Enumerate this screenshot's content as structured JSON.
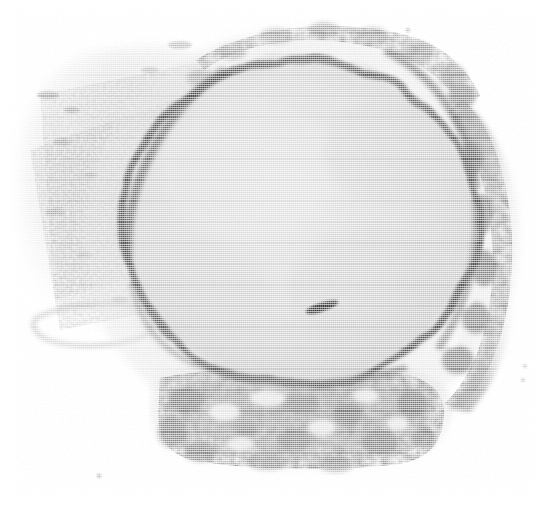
{
  "image": {
    "kind": "electron-micrograph",
    "reproduction": "halftone-line-screen-scan",
    "width": 550,
    "height": 507,
    "background_color": "#ffffff",
    "alt_text": "Halftone-printed transmission electron micrograph of a cell showing a large round nucleus bounded by a dark nuclear envelope, with a small dark intranuclear inclusion and granular cytoplasm surrounding it."
  },
  "palette": {
    "paper_white": "#ffffff",
    "nucleoplasm_gray": "#c9c9c9",
    "nucleoplasm_light": "#d8d8d8",
    "envelope_dark": "#3a3a3a",
    "envelope_mid": "#6b6b6b",
    "cytoplasm_gray": "#a8a8a8",
    "granule_dark": "#4a4a4a",
    "inclusion_dark": "#2e2e2e",
    "halftone_ink": "#555555"
  },
  "structures": {
    "nucleus": {
      "label": "nucleus",
      "center_x": 300,
      "center_y": 222,
      "radius_x": 178,
      "radius_y": 165,
      "fill": "#cfcfcf",
      "note": "large round pale body occupying the centre of the field"
    },
    "nuclear_envelope": {
      "label": "nuclear envelope",
      "stroke": "#3f3f3f",
      "stroke_width": 6,
      "note": "dark continuous rim around the nucleus, thicker at upper-left and right"
    },
    "inclusion": {
      "label": "intranuclear inclusion",
      "center_x": 322,
      "center_y": 307,
      "length": 34,
      "thickness": 9,
      "rotation_deg": -18,
      "fill": "#2e2e2e"
    },
    "cytoplasm_upper_left": {
      "label": "flocculent cytoplasm (upper left)",
      "fill": "#d5d5d5",
      "note": "pale granular material from top-left to mid-left margin"
    },
    "cytoplasm_lower": {
      "label": "granular cytoplasm (lower)",
      "fill": "#b9b9b9",
      "note": "mottled dense band below the nucleus, spanning x 150-455, y 380-470"
    },
    "cytoplasm_right": {
      "label": "granular cytoplasm (right)",
      "fill": "#8f8f8f",
      "note": "dark coarse granular rim along the right margin of the nucleus"
    },
    "speck_lower_left": {
      "label": "isolated speck",
      "center_x": 99,
      "center_y": 476,
      "radius": 2
    },
    "speck_right_a": {
      "label": "isolated speck",
      "center_x": 525,
      "center_y": 366,
      "radius": 1.6
    },
    "speck_right_b": {
      "label": "isolated speck",
      "center_x": 523,
      "center_y": 380,
      "radius": 1.6
    }
  },
  "halftone": {
    "screen_orientation": "horizontal",
    "line_period_px": 2.1,
    "dot_period_px": 2.0,
    "ink_opacity": 0.62
  },
  "caption": {
    "text": "",
    "visible": false
  }
}
